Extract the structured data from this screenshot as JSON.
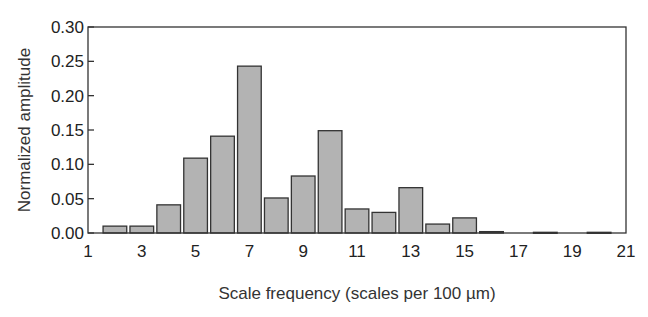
{
  "chart_data": {
    "type": "bar",
    "title": "",
    "xlabel": "Scale frequency (scales per 100 µm)",
    "ylabel": "Normalized amplitude",
    "xlim": [
      1,
      21
    ],
    "ylim": [
      0,
      0.3
    ],
    "x_ticks": [
      1,
      3,
      5,
      7,
      9,
      11,
      13,
      15,
      17,
      19,
      21
    ],
    "x_tick_labels": [
      "1",
      "3",
      "5",
      "7",
      "9",
      "11",
      "13",
      "15",
      "17",
      "19",
      "21"
    ],
    "y_ticks": [
      0.0,
      0.05,
      0.1,
      0.15,
      0.2,
      0.25,
      0.3
    ],
    "y_tick_labels": [
      "0.00",
      "0.05",
      "0.10",
      "0.15",
      "0.20",
      "0.25",
      "0.30"
    ],
    "grid": false,
    "legend": null,
    "x": [
      2,
      3,
      4,
      5,
      6,
      7,
      8,
      9,
      10,
      11,
      12,
      13,
      14,
      15,
      16,
      17,
      18,
      19,
      20
    ],
    "values": [
      0.01,
      0.01,
      0.041,
      0.109,
      0.141,
      0.243,
      0.051,
      0.083,
      0.149,
      0.035,
      0.03,
      0.066,
      0.013,
      0.022,
      0.002,
      0.0,
      0.001,
      0.0,
      0.001
    ],
    "colors": {
      "bar_fill": "#b3b3b3",
      "bar_edge": "#333333"
    }
  }
}
